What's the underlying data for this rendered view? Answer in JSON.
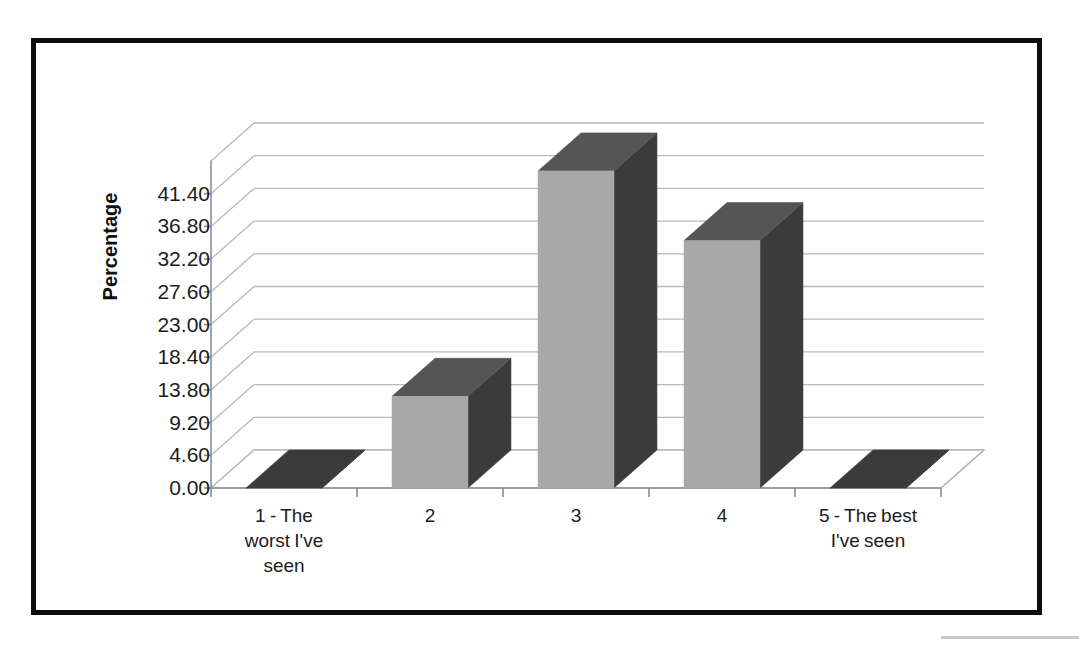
{
  "title": "",
  "axis": {
    "y_title": "Percentage"
  },
  "chart_data": {
    "type": "bar",
    "title": "",
    "xlabel": "",
    "ylabel": "Percentage",
    "categories": [
      "1 - The worst I've seen",
      "2",
      "3",
      "4",
      "5 - The best I've seen"
    ],
    "category_lines": [
      [
        "1 - The",
        "worst I've",
        "seen"
      ],
      [
        "2"
      ],
      [
        "3"
      ],
      [
        "4"
      ],
      [
        "5 - The best",
        "I've seen"
      ]
    ],
    "values": [
      0.0,
      12.9,
      44.6,
      34.8,
      0.0
    ],
    "ylim": [
      0.0,
      46.0
    ],
    "ytick_values": [
      0.0,
      4.6,
      9.2,
      13.8,
      18.4,
      23.0,
      27.6,
      32.2,
      36.8,
      41.4
    ],
    "ytick_labels": [
      "0.00",
      "4.60",
      "9.20",
      "13.80",
      "18.40",
      "23.00",
      "27.60",
      "32.20",
      "36.80",
      "41.40"
    ],
    "grid": true,
    "legend": false,
    "three_d": true,
    "colors": {
      "bar_front": "#a8a8a8",
      "bar_side": "#3b3b3b",
      "bar_top": "#555555",
      "gridline": "#b9b9b9",
      "axis": "#8c8c8c",
      "border": "#0d0d0d",
      "text": "#1c1c1c"
    }
  }
}
